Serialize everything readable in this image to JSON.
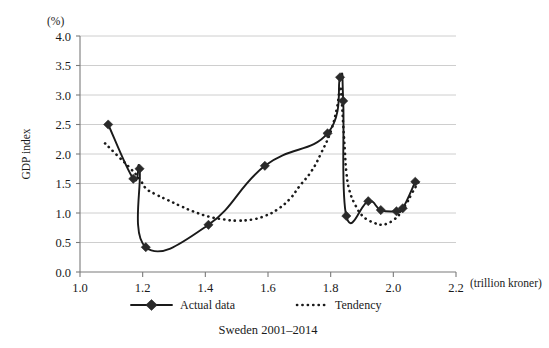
{
  "chart_data": {
    "type": "line",
    "title": "",
    "caption": "Sweden 2001–2014",
    "xlabel": "(trillion kroner)",
    "ylabel": "GDP index",
    "yunit": "(%)",
    "xlim": [
      1.0,
      2.2
    ],
    "ylim": [
      0.0,
      4.0
    ],
    "xticks": [
      "1.0",
      "1.2",
      "1.4",
      "1.6",
      "1.8",
      "2.0",
      "2.2"
    ],
    "xtick_values": [
      1.0,
      1.2,
      1.4,
      1.6,
      1.8,
      2.0,
      2.2
    ],
    "yticks": [
      "0.0",
      "0.5",
      "1.0",
      "1.5",
      "2.0",
      "2.5",
      "3.0",
      "3.5",
      "4.0"
    ],
    "ytick_values": [
      0.0,
      0.5,
      1.0,
      1.5,
      2.0,
      2.5,
      3.0,
      3.5,
      4.0
    ],
    "grid": true,
    "legend_position": "bottom",
    "series": [
      {
        "name": "Actual data",
        "style": "solid-with-diamond-markers",
        "color": "#1a1a1a",
        "points": [
          [
            1.09,
            2.5
          ],
          [
            1.17,
            1.58
          ],
          [
            1.19,
            1.75
          ],
          [
            1.21,
            0.42
          ],
          [
            1.41,
            0.8
          ],
          [
            1.59,
            1.8
          ],
          [
            1.79,
            2.35
          ],
          [
            1.83,
            3.3
          ],
          [
            1.84,
            2.9
          ],
          [
            1.85,
            0.95
          ],
          [
            1.92,
            1.2
          ],
          [
            1.96,
            1.05
          ],
          [
            2.01,
            1.03
          ],
          [
            2.03,
            1.08
          ],
          [
            2.07,
            1.53
          ]
        ]
      },
      {
        "name": "Tendency",
        "style": "dotted",
        "color": "#1a1a1a",
        "points": [
          [
            1.08,
            2.18
          ],
          [
            1.12,
            1.97
          ],
          [
            1.16,
            1.76
          ],
          [
            1.19,
            1.58
          ],
          [
            1.21,
            1.42
          ],
          [
            1.24,
            1.32
          ],
          [
            1.28,
            1.22
          ],
          [
            1.32,
            1.12
          ],
          [
            1.36,
            1.03
          ],
          [
            1.41,
            0.94
          ],
          [
            1.46,
            0.89
          ],
          [
            1.5,
            0.87
          ],
          [
            1.55,
            0.89
          ],
          [
            1.59,
            0.95
          ],
          [
            1.63,
            1.06
          ],
          [
            1.67,
            1.24
          ],
          [
            1.7,
            1.45
          ],
          [
            1.74,
            1.72
          ],
          [
            1.77,
            2.02
          ],
          [
            1.8,
            2.38
          ],
          [
            1.82,
            2.78
          ],
          [
            1.83,
            3.14
          ],
          [
            1.835,
            2.92
          ],
          [
            1.84,
            2.5
          ],
          [
            1.845,
            2.08
          ],
          [
            1.85,
            1.7
          ],
          [
            1.86,
            1.38
          ],
          [
            1.88,
            1.12
          ],
          [
            1.9,
            0.96
          ],
          [
            1.92,
            0.88
          ],
          [
            1.94,
            0.83
          ],
          [
            1.96,
            0.8
          ],
          [
            1.98,
            0.82
          ],
          [
            2.0,
            0.88
          ],
          [
            2.02,
            0.98
          ],
          [
            2.04,
            1.14
          ],
          [
            2.06,
            1.34
          ],
          [
            2.08,
            1.52
          ]
        ]
      }
    ]
  },
  "legend": {
    "items": [
      {
        "label": "Actual data",
        "style": "solid-with-diamond-markers"
      },
      {
        "label": "Tendency",
        "style": "dotted"
      }
    ]
  }
}
